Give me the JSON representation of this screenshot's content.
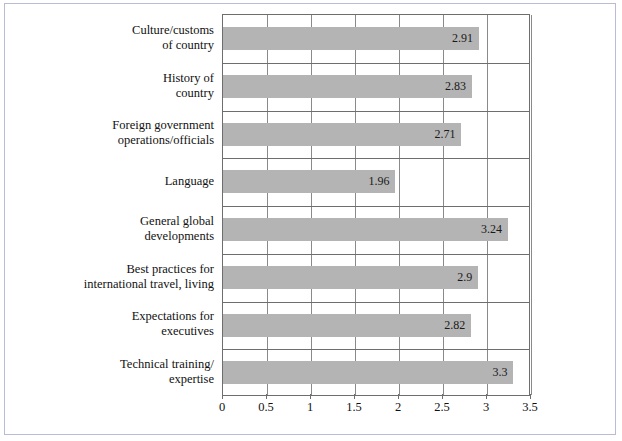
{
  "chart_data": {
    "type": "bar",
    "orientation": "horizontal",
    "title": "",
    "subtitle": "",
    "xlabel": "",
    "ylabel": "",
    "xlim": [
      0,
      3.5
    ],
    "xticks": [
      "0",
      "0.5",
      "1",
      "1.5",
      "2",
      "2.5",
      "3",
      "3.5"
    ],
    "xtick_values": [
      0,
      0.5,
      1,
      1.5,
      2,
      2.5,
      3,
      3.5
    ],
    "grid": true,
    "grid_axis": "both",
    "legend": false,
    "legend_position": "none",
    "bar_color": "#b4b4b4",
    "plot_border_color": "#6e6e6e",
    "figure_border_color": "#b9bcd4",
    "categories": [
      "Culture/customs\nof country",
      "History of\ncountry",
      "Foreign government\noperations/officials",
      "Language",
      "General global\ndevelopments",
      "Best practices for\ninternational travel, living",
      "Expectations for\nexecutives",
      "Technical training/\nexpertise"
    ],
    "values": [
      2.91,
      2.83,
      2.71,
      1.96,
      3.24,
      2.9,
      2.82,
      3.3
    ],
    "value_labels": [
      "2.91",
      "2.83",
      "2.71",
      "1.96",
      "3.24",
      "2.9",
      "2.82",
      "3.3"
    ]
  }
}
